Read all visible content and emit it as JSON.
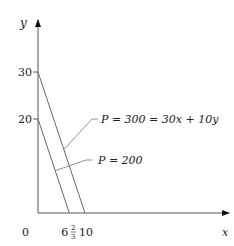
{
  "diagram": {
    "axes": {
      "x_label": "x",
      "y_label": "y",
      "origin_label": "0",
      "x_range": [
        0,
        30
      ],
      "y_range": [
        0,
        35
      ]
    },
    "y_ticks": [
      {
        "value": 30,
        "label": "30"
      },
      {
        "value": 20,
        "label": "20"
      }
    ],
    "x_ticks": [
      {
        "value": 6.6667,
        "label_whole": "6",
        "label_num": "2",
        "label_den": "3"
      },
      {
        "value": 10,
        "label": "10"
      }
    ],
    "lines": [
      {
        "name": "P=300",
        "label": "P = 300 = 30x + 10y",
        "x_intercept": 10,
        "y_intercept": 30
      },
      {
        "name": "P=200",
        "label": "P = 200",
        "x_intercept": 6.6667,
        "y_intercept": 20
      }
    ],
    "colors": {
      "axis": "#555555",
      "line": "#666666",
      "text": "#222222"
    }
  }
}
